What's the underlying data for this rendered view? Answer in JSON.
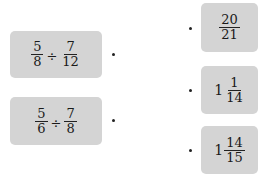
{
  "left_items": [
    {
      "a_num": "5",
      "a_den": "8",
      "operator": "÷",
      "b_num": "7",
      "b_den": "12"
    },
    {
      "a_num": "5",
      "a_den": "6",
      "operator": "÷",
      "b_num": "7",
      "b_den": "8"
    }
  ],
  "right_items": [
    {
      "whole": "",
      "num": "20",
      "den": "21"
    },
    {
      "whole": "1",
      "num": "1",
      "den": "14"
    },
    {
      "whole": "1",
      "num": "14",
      "den": "15"
    }
  ],
  "colors": {
    "box": "#d4d4d4",
    "text": "#1a1a1a"
  }
}
